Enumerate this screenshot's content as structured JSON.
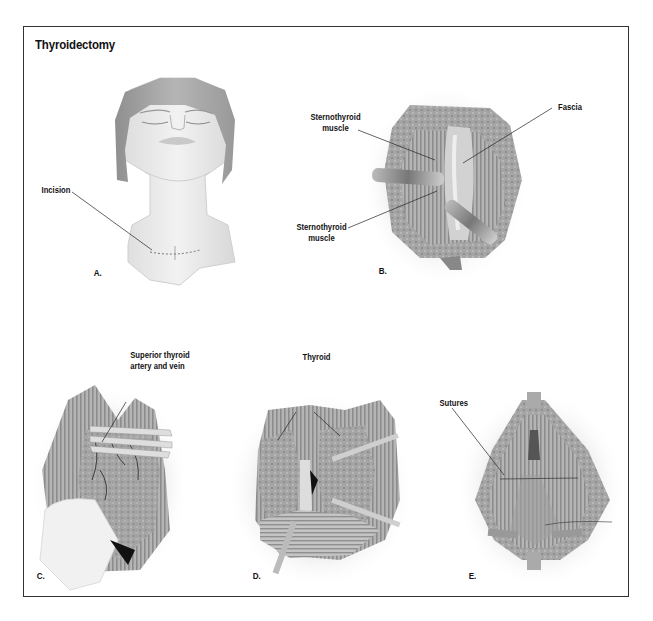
{
  "figure": {
    "title": "Thyroidectomy",
    "frame_color": "#333333",
    "panels": [
      {
        "id": "A",
        "letter": "A.",
        "subject": "head-and-neck-with-incision-line",
        "labels": [
          {
            "text": "Incision"
          }
        ]
      },
      {
        "id": "B",
        "letter": "B.",
        "subject": "neck-muscles-retracted-fascia",
        "labels": [
          {
            "line1": "Sternothyroid",
            "line2": "muscle"
          },
          {
            "text": "Fascia"
          },
          {
            "line1": "Sternothyroid",
            "line2": "muscle"
          }
        ]
      },
      {
        "id": "C",
        "letter": "C.",
        "subject": "thyroid-vessel-ligation",
        "labels": [
          {
            "line1": "Superior thyroid",
            "line2": "artery and vein"
          }
        ]
      },
      {
        "id": "D",
        "letter": "D.",
        "subject": "thyroid-lobes-exposed",
        "labels": [
          {
            "text": "Thyroid"
          }
        ]
      },
      {
        "id": "E",
        "letter": "E.",
        "subject": "closure-with-sutures",
        "labels": [
          {
            "text": "Sutures"
          }
        ]
      }
    ],
    "colors": {
      "skin": "#e6e6e6",
      "hair": "#a9a9a9",
      "muscle": "#9a9a9a",
      "muscle_stripe": "#bdbdbd",
      "tissue_light": "#d6d6d6",
      "shadow_halo": "#eeeeee",
      "leader_line": "#222222"
    }
  }
}
